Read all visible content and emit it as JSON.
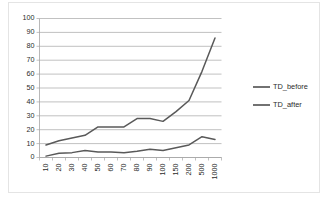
{
  "chart_data": {
    "type": "line",
    "title": "",
    "xlabel": "",
    "ylabel": "",
    "categories": [
      "10",
      "20",
      "30",
      "40",
      "50",
      "60",
      "70",
      "80",
      "90",
      "100",
      "150",
      "200",
      "500",
      "1000"
    ],
    "ylim": [
      0,
      100
    ],
    "yticks": [
      "0",
      "10",
      "20",
      "30",
      "40",
      "50",
      "60",
      "70",
      "80",
      "90",
      "100"
    ],
    "grid": true,
    "legend_position": "right",
    "series": [
      {
        "name": "TD_before",
        "color": "#595959",
        "values": [
          9,
          12,
          14,
          16,
          22,
          22,
          22,
          28,
          28,
          26,
          33,
          41,
          62,
          86
        ]
      },
      {
        "name": "TD_after",
        "color": "#595959",
        "values": [
          1,
          3,
          3.5,
          5,
          4,
          4,
          3.5,
          4.5,
          6,
          5,
          7,
          9,
          15,
          13
        ]
      }
    ]
  },
  "legend": {
    "items": [
      {
        "label": "TD_before"
      },
      {
        "label": "TD_after"
      }
    ]
  },
  "axes": {
    "y_tick_labels": [
      "100",
      "90",
      "80",
      "70",
      "60",
      "50",
      "40",
      "30",
      "20",
      "10",
      "0"
    ],
    "x_tick_labels": [
      "10",
      "20",
      "30",
      "40",
      "50",
      "60",
      "70",
      "80",
      "90",
      "100",
      "150",
      "200",
      "500",
      "1000"
    ]
  },
  "colors": {
    "series_line": "#595959",
    "grid": "#a6a6a6",
    "axis": "#a6a6a6",
    "text": "#2b2b2b",
    "frame": "#e4e4e4",
    "background": "#ffffff"
  }
}
